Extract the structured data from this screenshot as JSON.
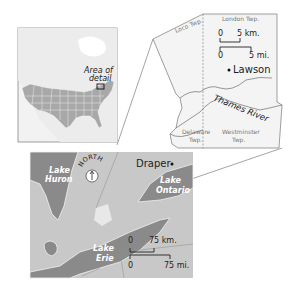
{
  "inset_map": {
    "area_label_line1": "Area of",
    "area_label_line2": "detail"
  },
  "detail_map": {
    "townships": {
      "loco": "Loco Twp.",
      "london": "London Twp.",
      "delaware_line1": "Delaware",
      "delaware_line2": "Twp.",
      "westminster_line1": "Westminster",
      "westminster_line2": "Twp."
    },
    "scale": {
      "km_zero": "0",
      "km_label": "5 km.",
      "mi_zero": "0",
      "mi_label": "5 mi."
    },
    "site": "Lawson",
    "river": "Thames River"
  },
  "regional_map": {
    "site": "Draper",
    "north_label": "NORTH",
    "lakes": {
      "huron_line1": "Lake",
      "huron_line2": "Huron",
      "ontario_line1": "Lake",
      "ontario_line2": "Ontario",
      "erie_line1": "Lake",
      "erie_line2": "Erie"
    },
    "scale": {
      "km_zero": "0",
      "km_label": "75 km.",
      "mi_zero": "0",
      "mi_label": "75 mi."
    }
  },
  "colors": {
    "land": "#c8c8c8",
    "water": "#8a8a8a",
    "highlight": "#e8e8e8",
    "line": "#555555",
    "background": "#ffffff"
  }
}
